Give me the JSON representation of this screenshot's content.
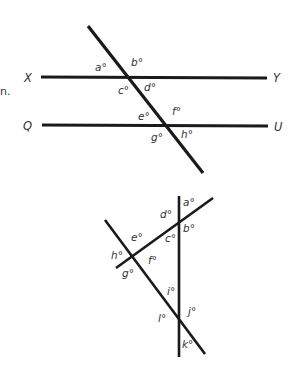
{
  "margin_fragment": "n.",
  "figure1": {
    "line_labels": {
      "left_top": "X",
      "right_top": "Y",
      "left_bottom": "Q",
      "right_bottom": "U"
    },
    "angles": {
      "a": "a°",
      "b": "b°",
      "c": "c°",
      "d": "d°",
      "e": "e°",
      "f": "f°",
      "g": "g°",
      "h": "h°"
    }
  },
  "figure2": {
    "angles": {
      "a": "a°",
      "b": "b°",
      "c": "c°",
      "d": "d°",
      "e": "e°",
      "f": "f°",
      "g": "g°",
      "h": "h°",
      "i": "i°",
      "j": "j°",
      "k": "k°",
      "l": "l°"
    }
  },
  "colors": {
    "line": "#1a1a1a",
    "text": "#333333",
    "background": "#ffffff"
  }
}
